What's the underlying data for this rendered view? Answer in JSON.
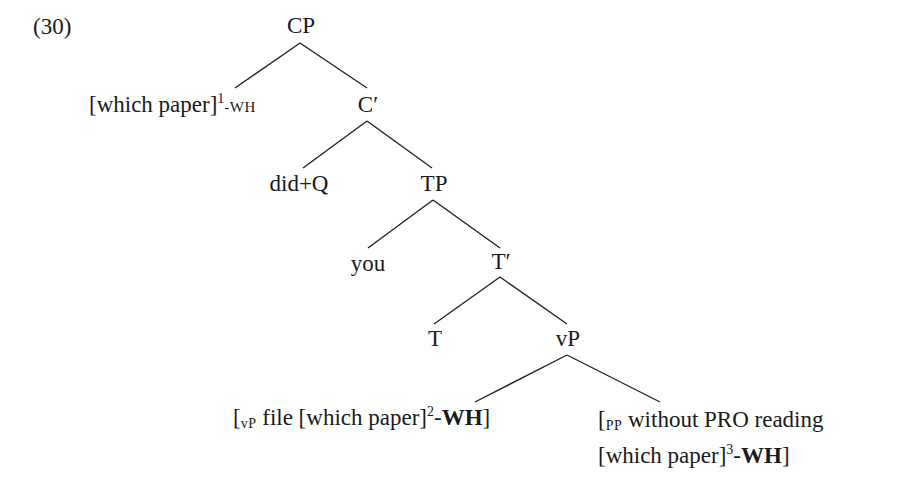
{
  "example_number": "(30)",
  "nodes": {
    "cp": "CP",
    "spec_cp": {
      "text": "[which paper]",
      "index": "1",
      "feature": "-WH"
    },
    "c_bar": "C′",
    "c_head": "did+Q",
    "tp": "TP",
    "spec_tp": "you",
    "t_bar": "T′",
    "t_head": "T",
    "vp": "vP",
    "vp_complement": {
      "open": "[",
      "label": "vP",
      "text": " file [which paper]",
      "index": "2",
      "dash": "-",
      "feature": "WH",
      "close": "]"
    },
    "pp_adjunct": {
      "open": "[",
      "label": "PP",
      "line1": " without PRO reading",
      "line2_text": "[which paper]",
      "index": "3",
      "dash": "-",
      "feature": "WH",
      "close": "]"
    }
  }
}
